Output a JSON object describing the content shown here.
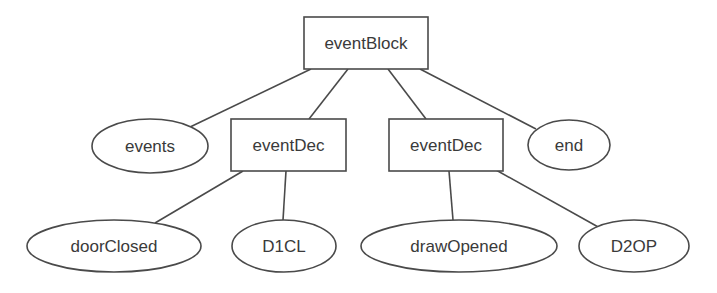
{
  "diagram": {
    "type": "tree",
    "colors": {
      "background": "#ffffff",
      "stroke": "#4a4a4a",
      "text": "#3a3a3a"
    },
    "nodes": {
      "eventBlock": {
        "label": "eventBlock",
        "shape": "rectangle"
      },
      "events": {
        "label": "events",
        "shape": "ellipse"
      },
      "eventDec1": {
        "label": "eventDec",
        "shape": "rectangle"
      },
      "eventDec2": {
        "label": "eventDec",
        "shape": "rectangle"
      },
      "end": {
        "label": "end",
        "shape": "ellipse"
      },
      "doorClosed": {
        "label": "doorClosed",
        "shape": "ellipse"
      },
      "D1CL": {
        "label": "D1CL",
        "shape": "ellipse"
      },
      "drawOpened": {
        "label": "drawOpened",
        "shape": "ellipse"
      },
      "D2OP": {
        "label": "D2OP",
        "shape": "ellipse"
      }
    },
    "edges": [
      {
        "from": "eventBlock",
        "to": "events"
      },
      {
        "from": "eventBlock",
        "to": "eventDec1"
      },
      {
        "from": "eventBlock",
        "to": "eventDec2"
      },
      {
        "from": "eventBlock",
        "to": "end"
      },
      {
        "from": "eventDec1",
        "to": "doorClosed"
      },
      {
        "from": "eventDec1",
        "to": "D1CL"
      },
      {
        "from": "eventDec2",
        "to": "drawOpened"
      },
      {
        "from": "eventDec2",
        "to": "D2OP"
      }
    ]
  }
}
